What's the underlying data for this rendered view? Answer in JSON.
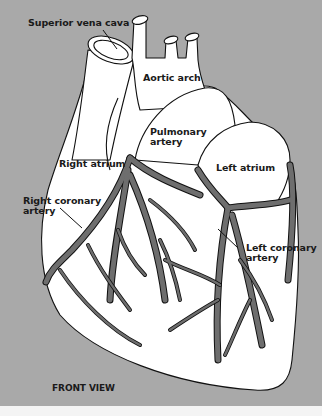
{
  "diagram": {
    "title": "FRONT VIEW",
    "colors": {
      "background": "#a9a9a9",
      "heart_fill": "#ffffff",
      "artery_fill": "#6e6e6e",
      "outline": "#111111"
    },
    "labels": {
      "superior_vena_cava": "Superior vena cava",
      "aortic_arch": "Aortic arch",
      "pulmonary_artery_line1": "Pulmonary",
      "pulmonary_artery_line2": "artery",
      "right_atrium": "Right atrium",
      "left_atrium": "Left atrium",
      "right_coronary_line1": "Right coronary",
      "right_coronary_line2": "artery",
      "left_coronary_line1": "Left coronary",
      "left_coronary_line2": "artery"
    }
  }
}
